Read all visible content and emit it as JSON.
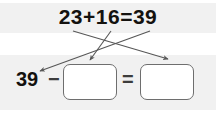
{
  "worksheet": {
    "type": "math-fact-family",
    "panels": {
      "top_label": "addition-equation-panel",
      "bottom_label": "subtraction-equation-panel"
    },
    "addition": {
      "expression": "23+16=39",
      "addend_1": "23",
      "operator": "+",
      "addend_2": "16",
      "equals": "=",
      "sum": "39"
    },
    "subtraction": {
      "minuend": "39",
      "minus": "−",
      "subtrahend_value": "",
      "equals": "=",
      "difference_value": ""
    },
    "arrows": [
      {
        "name": "arrow-addend1-to-difference-box",
        "from_term": "23",
        "to_target": "difference-box",
        "x1": 73,
        "y1": 31,
        "x2": 168,
        "y2": 59
      },
      {
        "name": "arrow-addend2-to-subtrahend-box",
        "from_term": "16",
        "to_target": "subtrahend-box",
        "x1": 111,
        "y1": 31,
        "x2": 90,
        "y2": 60
      },
      {
        "name": "arrow-sum-to-minuend",
        "from_term": "39",
        "to_target": "minuend-39",
        "x1": 150,
        "y1": 31,
        "x2": 40,
        "y2": 71
      }
    ],
    "colors": {
      "panel_background": "#f1f1f1",
      "page_background": "#ffffff",
      "text": "#14120f",
      "operator": "#3c3c3c",
      "box_border": "#6e6e6e",
      "box_fill": "#ffffff",
      "arrow": "#575757"
    }
  }
}
